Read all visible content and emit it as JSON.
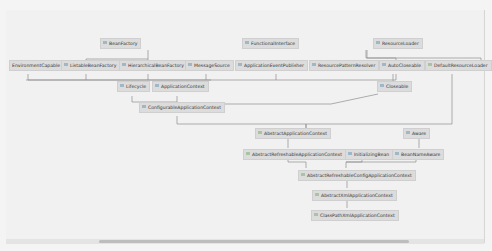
{
  "diagram": {
    "type": "uml-class-hierarchy",
    "nodes": [
      {
        "id": "BeanFactory",
        "label": "BeanFactory"
      },
      {
        "id": "FunctionalInterface",
        "label": "FunctionalInterface"
      },
      {
        "id": "ResourceLoader",
        "label": "ResourceLoader"
      },
      {
        "id": "EnvironmentCapable",
        "label": "EnvironmentCapable"
      },
      {
        "id": "ListableBeanFactory",
        "label": "ListableBeanFactory"
      },
      {
        "id": "HierarchicalBeanFactory",
        "label": "HierarchicalBeanFactory"
      },
      {
        "id": "MessageSource",
        "label": "MessageSource"
      },
      {
        "id": "ApplicationEventPublisher",
        "label": "ApplicationEventPublisher"
      },
      {
        "id": "ResourcePatternResolver",
        "label": "ResourcePatternResolver"
      },
      {
        "id": "AutoCloseable",
        "label": "AutoCloseable"
      },
      {
        "id": "DefaultResourceLoader",
        "label": "DefaultResourceLoader"
      },
      {
        "id": "Lifecycle",
        "label": "Lifecycle"
      },
      {
        "id": "ApplicationContext",
        "label": "ApplicationContext"
      },
      {
        "id": "Closeable",
        "label": "Closeable"
      },
      {
        "id": "ConfigurableApplicationContext",
        "label": "ConfigurableApplicationContext"
      },
      {
        "id": "AbstractApplicationContext",
        "label": "AbstractApplicationContext"
      },
      {
        "id": "Aware",
        "label": "Aware"
      },
      {
        "id": "AbstractRefreshableApplicationContext",
        "label": "AbstractRefreshableApplicationContext"
      },
      {
        "id": "InitializingBean",
        "label": "InitializingBean"
      },
      {
        "id": "BeanNameAware",
        "label": "BeanNameAware"
      },
      {
        "id": "AbstractRefreshableConfigApplicationContext",
        "label": "AbstractRefreshableConfigApplicationContext"
      },
      {
        "id": "AbstractXmlApplicationContext",
        "label": "AbstractXmlApplicationContext"
      },
      {
        "id": "ClassPathXmlApplicationContext",
        "label": "ClassPathXmlApplicationContext"
      }
    ],
    "edges": [
      [
        "ListableBeanFactory",
        "BeanFactory"
      ],
      [
        "HierarchicalBeanFactory",
        "BeanFactory"
      ],
      [
        "ResourcePatternResolver",
        "ResourceLoader"
      ],
      [
        "DefaultResourceLoader",
        "ResourceLoader"
      ],
      [
        "Closeable",
        "AutoCloseable"
      ],
      [
        "ApplicationContext",
        "EnvironmentCapable"
      ],
      [
        "ApplicationContext",
        "ListableBeanFactory"
      ],
      [
        "ApplicationContext",
        "HierarchicalBeanFactory"
      ],
      [
        "ApplicationContext",
        "MessageSource"
      ],
      [
        "ApplicationContext",
        "ApplicationEventPublisher"
      ],
      [
        "ApplicationContext",
        "ResourcePatternResolver"
      ],
      [
        "ConfigurableApplicationContext",
        "ApplicationContext"
      ],
      [
        "ConfigurableApplicationContext",
        "Lifecycle"
      ],
      [
        "ConfigurableApplicationContext",
        "Closeable"
      ],
      [
        "AbstractApplicationContext",
        "ConfigurableApplicationContext"
      ],
      [
        "AbstractApplicationContext",
        "DefaultResourceLoader"
      ],
      [
        "AbstractRefreshableApplicationContext",
        "AbstractApplicationContext"
      ],
      [
        "BeanNameAware",
        "Aware"
      ],
      [
        "AbstractRefreshableConfigApplicationContext",
        "AbstractRefreshableApplicationContext"
      ],
      [
        "AbstractRefreshableConfigApplicationContext",
        "InitializingBean"
      ],
      [
        "AbstractRefreshableConfigApplicationContext",
        "BeanNameAware"
      ],
      [
        "AbstractXmlApplicationContext",
        "AbstractRefreshableConfigApplicationContext"
      ],
      [
        "ClassPathXmlApplicationContext",
        "AbstractXmlApplicationContext"
      ]
    ]
  },
  "colors": {
    "node_bg": "#dcdcdc",
    "edge": "#8a8a8a",
    "background": "#f1f1f1"
  }
}
